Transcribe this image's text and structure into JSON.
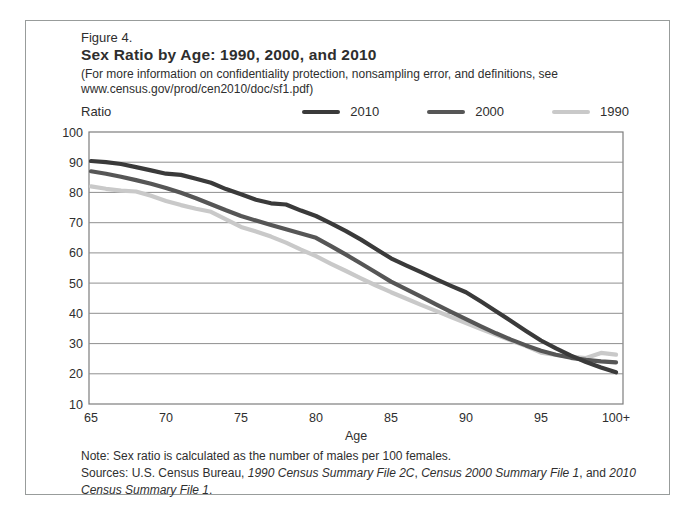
{
  "figure": {
    "label": "Figure 4.",
    "title": "Sex Ratio by Age: 1990, 2000, and 2010",
    "subtitle": "(For more information on confidentiality protection, nonsampling error, and definitions, see www.census.gov/prod/cen2010/doc/sf1.pdf)"
  },
  "notes": {
    "note": "Note: Sex ratio is calculated as the number of males per 100 females.",
    "sources_prefix": "Sources: U.S. Census Bureau, ",
    "source_1990": "1990 Census Summary File 2C",
    "sep_1": ", ",
    "source_2000": "Census 2000 Summary File 1",
    "sep_2": ", and ",
    "source_2010": "2010 Census Summary File 1",
    "sources_suffix": "."
  },
  "chart_data": {
    "type": "line",
    "title": "Sex Ratio by Age: 1990, 2000, and 2010",
    "xlabel": "Age",
    "ylabel": "Ratio",
    "ylim": [
      10,
      100
    ],
    "y_tick_step": 10,
    "grid": "horizontal-gridlines-on",
    "legend_position": "top",
    "x_tick_labels": [
      "65",
      "70",
      "75",
      "80",
      "85",
      "90",
      "95",
      "100+"
    ],
    "ages": [
      65,
      66,
      67,
      68,
      69,
      70,
      71,
      72,
      73,
      74,
      75,
      76,
      77,
      78,
      79,
      80,
      81,
      82,
      83,
      84,
      85,
      86,
      87,
      88,
      89,
      90,
      91,
      92,
      93,
      94,
      95,
      96,
      97,
      98,
      99,
      100
    ],
    "series": [
      {
        "name": "2010",
        "color": "#3a3a3a",
        "values": [
          90.4,
          90.0,
          89.4,
          88.4,
          87.3,
          86.2,
          85.8,
          84.5,
          83.2,
          81.1,
          79.4,
          77.6,
          76.4,
          76.0,
          74.0,
          72.2,
          69.8,
          67.2,
          64.4,
          61.3,
          58.2,
          55.9,
          53.6,
          51.3,
          49.1,
          47.0,
          43.9,
          40.7,
          37.5,
          34.2,
          31.0,
          28.4,
          26.0,
          23.9,
          22.1,
          20.5
        ]
      },
      {
        "name": "2000",
        "color": "#565656",
        "values": [
          87.0,
          86.2,
          85.2,
          84.1,
          82.9,
          81.5,
          79.9,
          78.1,
          76.1,
          74.1,
          72.2,
          70.7,
          69.2,
          67.8,
          66.4,
          65.0,
          62.2,
          59.4,
          56.5,
          53.5,
          50.5,
          48.0,
          45.5,
          43.0,
          40.5,
          38.1,
          35.7,
          33.4,
          31.3,
          29.4,
          27.6,
          26.3,
          25.3,
          24.6,
          24.1,
          23.8
        ]
      },
      {
        "name": "1990",
        "color": "#c9c9c9",
        "values": [
          82.0,
          81.2,
          80.6,
          80.3,
          78.9,
          77.2,
          75.8,
          74.6,
          73.6,
          71.1,
          68.6,
          67.1,
          65.4,
          63.4,
          61.1,
          58.9,
          56.4,
          54.0,
          51.6,
          49.2,
          47.0,
          44.9,
          42.8,
          40.8,
          38.8,
          36.8,
          34.8,
          32.9,
          31.0,
          29.2,
          27.0,
          26.2,
          25.6,
          25.2,
          26.9,
          26.3
        ]
      }
    ]
  },
  "colors": {
    "text": "#2e2e2e",
    "panel_border": "#989c9b",
    "plot_border": "#7d7d7d",
    "gridline": "#8f8f8f",
    "background": "#ffffff"
  }
}
